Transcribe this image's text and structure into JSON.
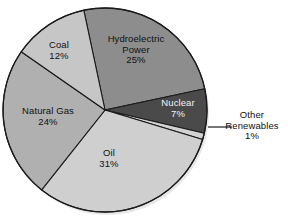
{
  "chart_data": {
    "type": "pie",
    "title": "",
    "subtitle": "",
    "xlabel": "",
    "ylabel": "",
    "legend_position": "none",
    "grid": false,
    "units": "percent",
    "total": 100,
    "categories": [
      "Hydroelectric Power",
      "Nuclear",
      "Other Renewables",
      "Oil",
      "Natural Gas",
      "Coal"
    ],
    "values": [
      25,
      7,
      1,
      31,
      24,
      12
    ],
    "slices": [
      {
        "label": "Hydroelectric Power",
        "label_line1": "Hydroelectric",
        "label_line2": "Power",
        "value": 25,
        "value_text": "25%",
        "color": "#8d8d8d",
        "label_placement": "inside",
        "start_angle_deg": -12,
        "end_angle_deg": 78
      },
      {
        "label": "Nuclear",
        "label_line1": "Nuclear",
        "label_line2": "",
        "value": 7,
        "value_text": "7%",
        "color": "#4a4a4a",
        "label_placement": "inside",
        "start_angle_deg": 78,
        "end_angle_deg": 103.2
      },
      {
        "label": "Other Renewables",
        "label_line1": "Other",
        "label_line2": "Renewables",
        "value": 1,
        "value_text": "1%",
        "color": "#d2d2d2",
        "label_placement": "outside-right",
        "start_angle_deg": 103.2,
        "end_angle_deg": 106.8
      },
      {
        "label": "Oil",
        "label_line1": "Oil",
        "label_line2": "",
        "value": 31,
        "value_text": "31%",
        "color": "#cfcfcf",
        "label_placement": "inside",
        "start_angle_deg": 106.8,
        "end_angle_deg": 218.4
      },
      {
        "label": "Natural Gas",
        "label_line1": "Natural Gas",
        "label_line2": "",
        "value": 24,
        "value_text": "24%",
        "color": "#b0b0b0",
        "label_placement": "inside",
        "start_angle_deg": 218.4,
        "end_angle_deg": 304.8
      },
      {
        "label": "Coal",
        "label_line1": "Coal",
        "label_line2": "",
        "value": 12,
        "value_text": "12%",
        "color": "#c6c6c6",
        "label_placement": "inside",
        "start_angle_deg": 304.8,
        "end_angle_deg": 348
      }
    ],
    "geometry": {
      "center_x": 105,
      "center_y": 110,
      "radius": 102
    },
    "style": {
      "background": "#ffffff",
      "outline_color": "#1a1a1a",
      "text_color": "#111111",
      "nuclear_text_color": "#f2f2f2",
      "leader_line_color": "#1a1a1a"
    }
  }
}
